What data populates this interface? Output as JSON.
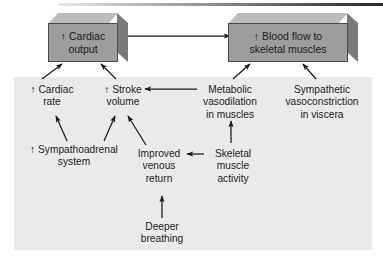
{
  "diagram": {
    "top_rule": "gradient-rule",
    "boxes": [
      {
        "id": "cardiac-output",
        "arrow": "↑",
        "line1": "Cardiac",
        "line2": "output",
        "fill": "#9d9d9d"
      },
      {
        "id": "blood-flow",
        "arrow": "↑",
        "line1": "Blood flow to",
        "line2": "skeletal muscles",
        "fill": "#9d9d9d"
      }
    ],
    "labels": [
      {
        "id": "cardiac-rate",
        "arrow": "↑",
        "line1": "Cardiac",
        "line2": "rate",
        "line3": ""
      },
      {
        "id": "stroke-volume",
        "arrow": "↑",
        "line1": "Stroke",
        "line2": "volume",
        "line3": ""
      },
      {
        "id": "metabolic-vasodilation",
        "arrow": "",
        "line1": "Metabolic",
        "line2": "vasodilation",
        "line3": "in muscles"
      },
      {
        "id": "sympathetic-vasoconstriction",
        "arrow": "",
        "line1": "Sympathetic",
        "line2": "vasoconstriction",
        "line3": "in viscera"
      },
      {
        "id": "sympathoadrenal-system",
        "arrow": "↑",
        "line1": "Sympathoadrenal",
        "line2": "system",
        "line3": ""
      },
      {
        "id": "improved-venous-return",
        "arrow": "",
        "line1": "Improved",
        "line2": "venous",
        "line3": "return"
      },
      {
        "id": "skeletal-muscle-activity",
        "arrow": "",
        "line1": "Skeletal",
        "line2": "muscle",
        "line3": "activity"
      },
      {
        "id": "deeper-breathing",
        "arrow": "",
        "line1": "Deeper",
        "line2": "breathing",
        "line3": ""
      }
    ],
    "connections": [
      {
        "from": "cardiac-output",
        "to": "blood-flow",
        "kind": "horizontal-arrow"
      },
      {
        "from": "cardiac-rate",
        "to": "cardiac-output",
        "kind": "diagonal-arrow"
      },
      {
        "from": "stroke-volume",
        "to": "cardiac-output",
        "kind": "diagonal-arrow"
      },
      {
        "from": "metabolic-vasodilation",
        "to": "blood-flow",
        "kind": "diagonal-arrow"
      },
      {
        "from": "sympathetic-vasoconstriction",
        "to": "blood-flow",
        "kind": "diagonal-arrow"
      },
      {
        "from": "metabolic-vasodilation",
        "to": "stroke-volume",
        "kind": "horizontal-arrow"
      },
      {
        "from": "sympathoadrenal-system",
        "to": "cardiac-rate",
        "kind": "diagonal-arrow"
      },
      {
        "from": "sympathoadrenal-system",
        "to": "stroke-volume",
        "kind": "diagonal-arrow"
      },
      {
        "from": "improved-venous-return",
        "to": "stroke-volume",
        "kind": "diagonal-arrow"
      },
      {
        "from": "skeletal-muscle-activity",
        "to": "improved-venous-return",
        "kind": "horizontal-arrow"
      },
      {
        "from": "skeletal-muscle-activity",
        "to": "metabolic-vasodilation",
        "kind": "vertical-arrow"
      },
      {
        "from": "deeper-breathing",
        "to": "improved-venous-return",
        "kind": "vertical-arrow"
      }
    ],
    "colors": {
      "panel_background": "#eaeaea",
      "page_background": "#ffffff",
      "box_front": "#9d9d9d",
      "box_top": "#bcbcbc",
      "box_side": "#7a7a7a",
      "ink": "#1b1b1b"
    }
  }
}
